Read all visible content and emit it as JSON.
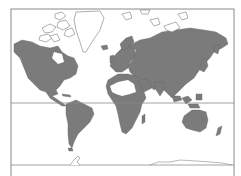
{
  "map": {
    "projection": "world map (Mercator-like)",
    "colors": {
      "land": "#7b7b7b",
      "ocean": "#ffffff",
      "ice_outline": "#7b7b7b",
      "frame": "#8a8a8a"
    },
    "features": [
      "north-america",
      "south-america",
      "greenland",
      "arctic-islands",
      "europe",
      "africa",
      "sahara",
      "asia",
      "australia",
      "new-zealand",
      "indonesia",
      "antarctica-coastline"
    ],
    "reference_lines": [
      "equator",
      "antarctic-line"
    ]
  }
}
